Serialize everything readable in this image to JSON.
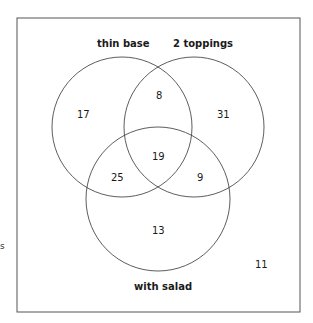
{
  "diagram": {
    "type": "venn",
    "sets": [
      {
        "name": "thin base"
      },
      {
        "name": "2 toppings"
      },
      {
        "name": "with salad"
      }
    ],
    "regions": {
      "thin_only": "17",
      "toppings_only": "31",
      "salad_only": "13",
      "thin_toppings": "8",
      "thin_salad": "25",
      "toppings_salad": "9",
      "all_three": "19",
      "outside": "11"
    },
    "edge_fragment": "s"
  }
}
